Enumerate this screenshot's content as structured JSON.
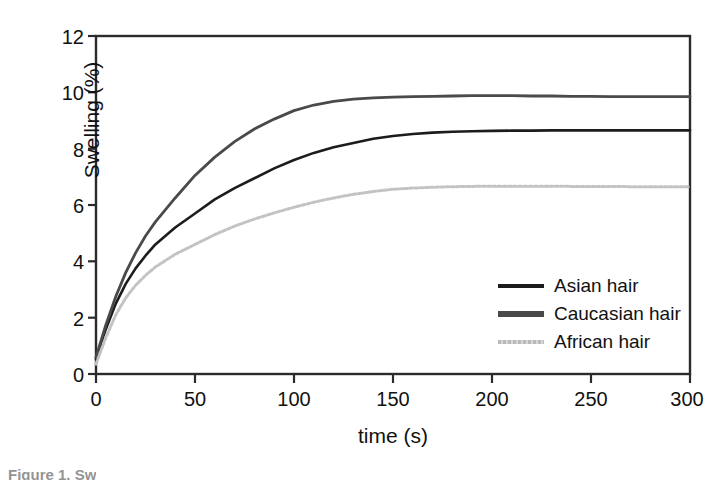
{
  "chart_data": {
    "type": "line",
    "title": "",
    "xlabel": "time (s)",
    "ylabel": "Swelling (%)",
    "xlim": [
      0,
      300
    ],
    "ylim": [
      0,
      12
    ],
    "xticks": [
      0,
      50,
      100,
      150,
      200,
      250,
      300
    ],
    "yticks": [
      0,
      2,
      4,
      6,
      8,
      10,
      12
    ],
    "xtick_labels": [
      "0",
      "50",
      "100",
      "150",
      "200",
      "250",
      "300"
    ],
    "ytick_labels": [
      "0",
      "2",
      "4",
      "6",
      "8",
      "10",
      "12"
    ],
    "grid": false,
    "legend_position": "center-right-inside",
    "x": [
      0,
      5,
      10,
      15,
      20,
      25,
      30,
      40,
      50,
      60,
      70,
      80,
      90,
      100,
      110,
      120,
      130,
      140,
      150,
      160,
      170,
      180,
      190,
      200,
      210,
      220,
      230,
      240,
      250,
      260,
      270,
      280,
      290,
      300
    ],
    "series": [
      {
        "name": "Asian hair",
        "color": "#1c1c1c",
        "style": "solid",
        "width": 2.6,
        "values": [
          0.55,
          1.6,
          2.5,
          3.2,
          3.75,
          4.2,
          4.6,
          5.2,
          5.7,
          6.2,
          6.6,
          6.95,
          7.3,
          7.6,
          7.85,
          8.05,
          8.2,
          8.35,
          8.45,
          8.52,
          8.57,
          8.6,
          8.62,
          8.63,
          8.64,
          8.64,
          8.65,
          8.65,
          8.65,
          8.65,
          8.65,
          8.65,
          8.65,
          8.65
        ]
      },
      {
        "name": "Caucasian hair",
        "color": "#4a4a4a",
        "style": "solid",
        "width": 2.8,
        "values": [
          0.6,
          1.75,
          2.75,
          3.6,
          4.3,
          4.9,
          5.4,
          6.25,
          7.05,
          7.7,
          8.25,
          8.7,
          9.05,
          9.35,
          9.55,
          9.68,
          9.76,
          9.8,
          9.83,
          9.85,
          9.86,
          9.87,
          9.88,
          9.88,
          9.88,
          9.87,
          9.87,
          9.86,
          9.86,
          9.85,
          9.85,
          9.85,
          9.85,
          9.85
        ]
      },
      {
        "name": "African hair",
        "color": "#c3c3c3",
        "style": "dotted",
        "width": 3.0,
        "values": [
          0.35,
          1.3,
          2.1,
          2.7,
          3.15,
          3.5,
          3.8,
          4.25,
          4.6,
          4.95,
          5.25,
          5.5,
          5.72,
          5.92,
          6.1,
          6.25,
          6.38,
          6.48,
          6.56,
          6.6,
          6.63,
          6.65,
          6.66,
          6.67,
          6.67,
          6.67,
          6.67,
          6.66,
          6.66,
          6.66,
          6.65,
          6.65,
          6.65,
          6.65
        ]
      }
    ]
  },
  "legend": {
    "items": [
      {
        "label": "Asian hair",
        "swatch": "line-swatch-dark"
      },
      {
        "label": "Caucasian hair",
        "swatch": "line-swatch-gray"
      },
      {
        "label": "African hair",
        "swatch": "line-swatch-light"
      }
    ]
  },
  "caption": {
    "text": "Figure 1.  Sw"
  }
}
